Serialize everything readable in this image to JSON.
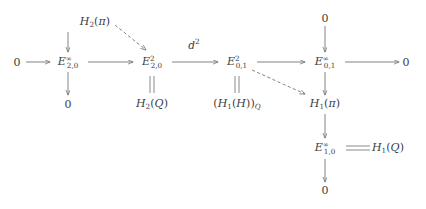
{
  "diagram": {
    "type": "commutative-diagram",
    "nodes": {
      "h2_pi": {
        "label": "H2(pi)",
        "base": "H",
        "sub": "2",
        "sup": "",
        "arg": "(π)",
        "x": 95,
        "y": 22
      },
      "zero_left": {
        "label": "0",
        "base": "0",
        "sub": "",
        "sup": "",
        "arg": "",
        "x": 17,
        "y": 62
      },
      "e2_0_inf": {
        "label": "E^inf_{2,0}",
        "base": "E",
        "sub": "2,0",
        "sup": "∞",
        "arg": "",
        "x": 68,
        "y": 62
      },
      "e2_0_2": {
        "label": "E^2_{2,0}",
        "base": "E",
        "sub": "2,0",
        "sup": "2",
        "arg": "",
        "x": 152,
        "y": 62
      },
      "e0_1_2": {
        "label": "E^2_{0,1}",
        "base": "E",
        "sub": "0,1",
        "sup": "2",
        "arg": "",
        "x": 237,
        "y": 62
      },
      "e0_1_inf": {
        "label": "E^inf_{0,1}",
        "base": "E",
        "sub": "0,1",
        "sup": "∞",
        "arg": "",
        "x": 325,
        "y": 62
      },
      "zero_right": {
        "label": "0",
        "base": "0",
        "sub": "",
        "sup": "",
        "arg": "",
        "x": 406,
        "y": 62
      },
      "zero_top": {
        "label": "0",
        "base": "0",
        "sub": "",
        "sup": "",
        "arg": "",
        "x": 325,
        "y": 18
      },
      "zero_below_l": {
        "label": "0",
        "base": "0",
        "sub": "",
        "sup": "",
        "arg": "",
        "x": 68,
        "y": 104
      },
      "h2_q": {
        "label": "H2(Q)",
        "base": "H",
        "sub": "2",
        "sup": "",
        "arg": "(Q)",
        "x": 152,
        "y": 104
      },
      "h1h_q": {
        "label": "(H1(H))_Q",
        "base": "",
        "sub": "",
        "sup": "",
        "arg": "",
        "x": 237,
        "y": 104
      },
      "h1_pi": {
        "label": "H1(pi)",
        "base": "H",
        "sub": "1",
        "sup": "",
        "arg": "(π)",
        "x": 325,
        "y": 104
      },
      "e1_0_inf": {
        "label": "E^inf_{1,0}",
        "base": "E",
        "sub": "1,0",
        "sup": "∞",
        "arg": "",
        "x": 325,
        "y": 148
      },
      "h1_q": {
        "label": "H1(Q)",
        "base": "H",
        "sub": "1",
        "sup": "",
        "arg": "(Q)",
        "x": 388,
        "y": 148
      },
      "zero_bottom": {
        "label": "0",
        "base": "0",
        "sub": "",
        "sup": "",
        "arg": "",
        "x": 325,
        "y": 190
      }
    },
    "edge_labels": {
      "d2": {
        "text": "d",
        "sup": "2",
        "x": 194,
        "y": 44
      }
    },
    "colors": {
      "stroke": "#6d6d6d",
      "text": "#3c3c3c",
      "background": "#ffffff"
    }
  }
}
